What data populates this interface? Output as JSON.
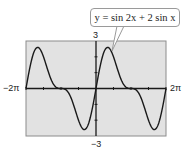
{
  "chart_data": {
    "type": "line",
    "title": "",
    "function": "y = sin 2x + 2 sin x",
    "series": [
      {
        "name": "y = sin 2x + 2 sin x",
        "x": [
          -6.2832,
          -5.7596,
          -5.236,
          -4.7124,
          -4.1888,
          -3.6652,
          -3.1416,
          -2.618,
          -2.0944,
          -1.5708,
          -1.0472,
          -0.5236,
          0,
          0.5236,
          1.0472,
          1.5708,
          2.0944,
          2.618,
          3.1416,
          3.6652,
          4.1888,
          4.7124,
          5.236,
          5.7596,
          6.2832
        ],
        "y": [
          0,
          1.866,
          2.598,
          2.0,
          0.866,
          0.134,
          0,
          -0.134,
          -0.866,
          -2.0,
          -2.598,
          -1.866,
          0,
          1.866,
          2.598,
          2.0,
          0.866,
          0.134,
          0,
          -0.134,
          -0.866,
          -2.0,
          -2.598,
          -1.866,
          0
        ]
      }
    ],
    "xlim": [
      -6.2832,
      6.2832
    ],
    "ylim": [
      -3,
      3
    ],
    "xlabel": "",
    "ylabel": "",
    "x_tick_labels": [
      "-2π",
      "2π"
    ],
    "y_tick_labels": [
      "3",
      "-3"
    ],
    "x_scale": "π/2",
    "y_scale": 1,
    "grid": false,
    "legend": "none",
    "annotation": "y = sin 2x + 2 sin x",
    "colors": {
      "plot_background": "#e2e2e2",
      "curve": "#1a1a1a",
      "axes": "#1a1a1a",
      "frame": "#8c8c8c"
    }
  },
  "labels": {
    "x_min": "−2π",
    "x_max": "2π",
    "y_max": "3",
    "y_min": "−3",
    "callout": "y = sin 2x + 2 sin x"
  }
}
